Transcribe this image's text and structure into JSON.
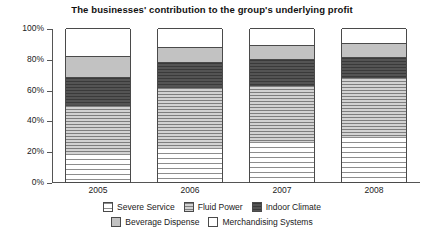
{
  "chart_data": {
    "type": "bar",
    "title": "The businesses' contribution to the group's underlying profit",
    "xlabel": "",
    "ylabel": "",
    "ylim": [
      0,
      100
    ],
    "ytick_labels": [
      "100%",
      "80%",
      "60%",
      "40%",
      "20%",
      "0%"
    ],
    "ytick_values": [
      100,
      80,
      60,
      40,
      20,
      0
    ],
    "grid": false,
    "stacked": true,
    "stack_order": "bottom-to-top",
    "legend_position": "bottom",
    "categories": [
      "2005",
      "2006",
      "2007",
      "2008"
    ],
    "series": [
      {
        "name": "Severe Service",
        "values": [
          18,
          22,
          26,
          29
        ],
        "swatch": "severe"
      },
      {
        "name": "Fluid Power",
        "values": [
          32,
          40,
          37,
          39
        ],
        "swatch": "fluid"
      },
      {
        "name": "Indoor Climate",
        "values": [
          18,
          16,
          17,
          13
        ],
        "swatch": "indoor"
      },
      {
        "name": "Beverage Dispense",
        "values": [
          14,
          10,
          9,
          9
        ],
        "swatch": "beverage"
      },
      {
        "name": "Merchandising Systems",
        "values": [
          18,
          12,
          11,
          10
        ],
        "swatch": "merch"
      }
    ]
  }
}
